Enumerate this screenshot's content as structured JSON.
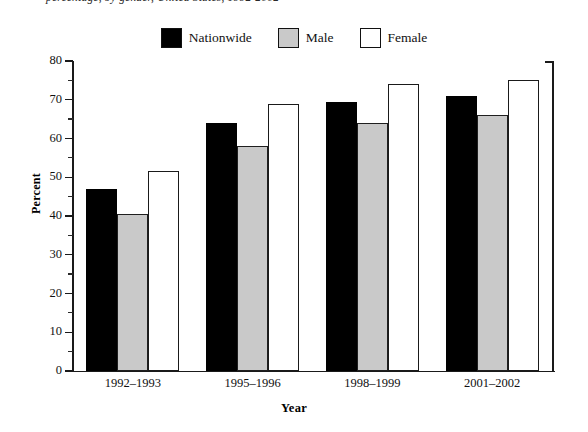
{
  "caption": {
    "text": "percentage, by gender, United States, 1992-2002"
  },
  "legend": {
    "position": "top-center",
    "items": [
      {
        "label": "Nationwide",
        "color": "#000000",
        "swatch": "solid-black"
      },
      {
        "label": "Male",
        "color": "#c9c9c9",
        "swatch": "solid-gray"
      },
      {
        "label": "Female",
        "color": "#ffffff",
        "swatch": "outline-white"
      }
    ]
  },
  "chart_data": {
    "type": "bar",
    "title": "",
    "subtitle": "",
    "xlabel": "Year",
    "ylabel": "Percent",
    "categories": [
      "1992–1993",
      "1995–1996",
      "1998–1999",
      "2001–2002"
    ],
    "series": [
      {
        "name": "Nationwide",
        "color": "#000000",
        "values": [
          47,
          64,
          69.5,
          71
        ]
      },
      {
        "name": "Male",
        "color": "#c9c9c9",
        "values": [
          40.5,
          58,
          64,
          66
        ]
      },
      {
        "name": "Female",
        "color": "#ffffff",
        "values": [
          51.5,
          69,
          74,
          75
        ]
      }
    ],
    "ylim": [
      0,
      80
    ],
    "ytick_step": 10,
    "yminor_step": 5,
    "yticks": [
      0,
      10,
      20,
      30,
      40,
      50,
      60,
      70,
      80
    ],
    "ytick_labels": [
      "0",
      "10",
      "20",
      "30",
      "40",
      "50",
      "60",
      "70",
      "80"
    ],
    "grid": false,
    "legend_position": "top-center",
    "axis_frame": "left-bottom-right"
  }
}
